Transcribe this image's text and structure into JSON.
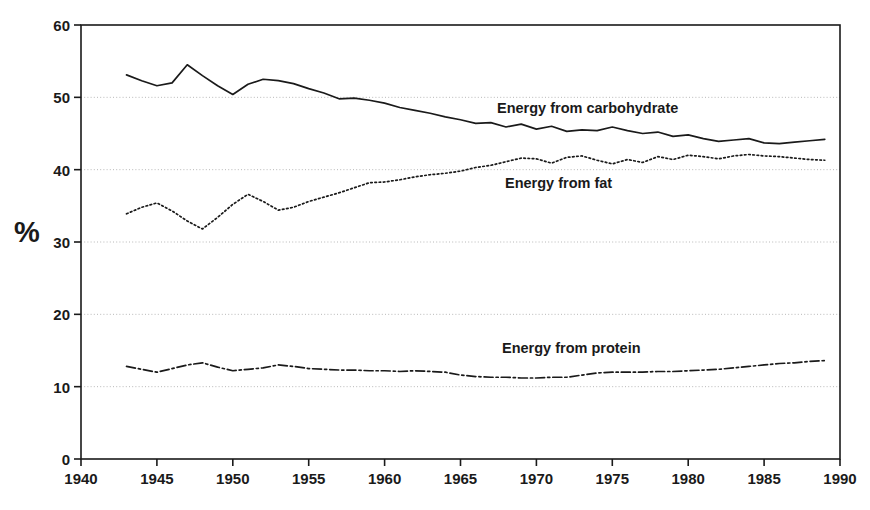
{
  "axis_title_y": "%",
  "y_ticks": [
    0,
    10,
    20,
    30,
    40,
    50,
    60
  ],
  "x_ticks": [
    1940,
    1945,
    1950,
    1955,
    1960,
    1965,
    1970,
    1975,
    1980,
    1985,
    1990
  ],
  "labels": {
    "carbohydrate": "Energy from carbohydrate",
    "fat": "Energy from fat",
    "protein": "Energy from protein"
  },
  "colors": {
    "line": "#1a1a1a",
    "grid": "#b8b8b8",
    "axis": "#1a1a1a",
    "background": "#ffffff"
  },
  "chart_data": {
    "type": "line",
    "title": "",
    "xlabel": "",
    "ylabel": "%",
    "xlim": [
      1940,
      1990
    ],
    "ylim": [
      0,
      60
    ],
    "xticks": [
      1940,
      1945,
      1950,
      1955,
      1960,
      1965,
      1970,
      1975,
      1980,
      1985,
      1990
    ],
    "yticks": [
      0,
      10,
      20,
      30,
      40,
      50,
      60
    ],
    "grid": "horizontal-dotted",
    "legend": "inline-labels",
    "x": [
      1943,
      1944,
      1945,
      1946,
      1947,
      1948,
      1949,
      1950,
      1951,
      1952,
      1953,
      1954,
      1955,
      1956,
      1957,
      1958,
      1959,
      1960,
      1961,
      1962,
      1963,
      1964,
      1965,
      1966,
      1967,
      1968,
      1969,
      1970,
      1971,
      1972,
      1973,
      1974,
      1975,
      1976,
      1977,
      1978,
      1979,
      1980,
      1981,
      1982,
      1983,
      1984,
      1985,
      1986,
      1987,
      1988,
      1989
    ],
    "series": [
      {
        "name": "Energy from carbohydrate",
        "style": "solid",
        "values": [
          53.1,
          52.3,
          51.6,
          52.0,
          54.5,
          53.0,
          51.6,
          50.4,
          51.8,
          52.5,
          52.3,
          51.9,
          51.2,
          50.6,
          49.8,
          49.9,
          49.6,
          49.2,
          48.6,
          48.2,
          47.8,
          47.3,
          46.9,
          46.4,
          46.5,
          45.9,
          46.3,
          45.6,
          46.0,
          45.3,
          45.5,
          45.4,
          45.9,
          45.4,
          45.0,
          45.2,
          44.6,
          44.8,
          44.3,
          43.9,
          44.1,
          44.3,
          43.7,
          43.6,
          43.8,
          44.0,
          44.2
        ]
      },
      {
        "name": "Energy from fat",
        "style": "dotted",
        "values": [
          33.9,
          34.8,
          35.4,
          34.3,
          32.9,
          31.8,
          33.4,
          35.2,
          36.6,
          35.6,
          34.4,
          34.8,
          35.6,
          36.2,
          36.8,
          37.5,
          38.2,
          38.3,
          38.6,
          39.0,
          39.3,
          39.5,
          39.8,
          40.3,
          40.6,
          41.1,
          41.6,
          41.5,
          40.9,
          41.7,
          41.9,
          41.3,
          40.8,
          41.4,
          41.0,
          41.8,
          41.4,
          42.0,
          41.8,
          41.5,
          41.9,
          42.1,
          41.9,
          41.8,
          41.6,
          41.4,
          41.3
        ]
      },
      {
        "name": "Energy from protein",
        "style": "dash-dot",
        "values": [
          12.8,
          12.4,
          12.0,
          12.5,
          13.0,
          13.3,
          12.7,
          12.2,
          12.4,
          12.6,
          13.0,
          12.8,
          12.5,
          12.4,
          12.3,
          12.3,
          12.2,
          12.2,
          12.1,
          12.2,
          12.1,
          12.0,
          11.6,
          11.4,
          11.3,
          11.3,
          11.2,
          11.2,
          11.3,
          11.3,
          11.6,
          11.9,
          12.0,
          12.0,
          12.0,
          12.1,
          12.1,
          12.2,
          12.3,
          12.4,
          12.6,
          12.8,
          13.0,
          13.2,
          13.3,
          13.5,
          13.6
        ]
      }
    ]
  }
}
